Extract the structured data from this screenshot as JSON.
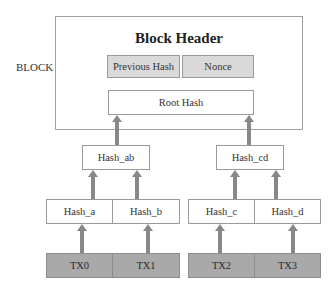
{
  "diagram": {
    "block_label": "BLOCK",
    "header_title": "Block Header",
    "header_fields": [
      {
        "label": "Previous Hash"
      },
      {
        "label": "Nonce"
      }
    ],
    "root_hash": "Root Hash",
    "level2": [
      {
        "label": "Hash_ab"
      },
      {
        "label": "Hash_cd"
      }
    ],
    "level1": [
      {
        "label": "Hash_a"
      },
      {
        "label": "Hash_b"
      },
      {
        "label": "Hash_c"
      },
      {
        "label": "Hash_d"
      }
    ],
    "transactions": [
      {
        "label": "TX0"
      },
      {
        "label": "TX1"
      },
      {
        "label": "TX2"
      },
      {
        "label": "TX3"
      }
    ],
    "colors": {
      "border": "#9a9a9a",
      "header_field_fill": "#d9d9d9",
      "tx_fill": "#a9a9a9",
      "arrow": "#888888"
    }
  }
}
